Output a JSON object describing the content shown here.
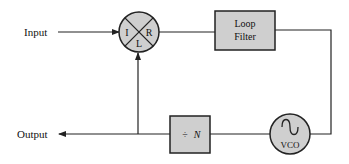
{
  "diagram": {
    "colors": {
      "block_fill": "#cfcfcf",
      "stroke": "#222222",
      "background": "#ffffff"
    },
    "labels": {
      "input": "Input",
      "output": "Output"
    },
    "mixer": {
      "port_i": "I",
      "port_r": "R",
      "port_l": "L"
    },
    "loop_filter": {
      "line1": "Loop",
      "line2": "Filter"
    },
    "divider": {
      "symbol": "÷",
      "variable": "N"
    },
    "vco": {
      "label": "VCO",
      "icon": "sine-wave-icon"
    }
  }
}
